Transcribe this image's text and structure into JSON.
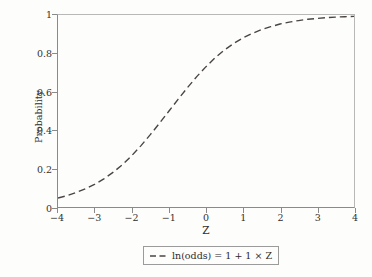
{
  "chart_data": {
    "type": "line",
    "title": "",
    "subtitle": "",
    "xlabel": "Z",
    "ylabel": "Probability",
    "xlim": [
      -4,
      4
    ],
    "ylim": [
      0,
      1
    ],
    "grid": false,
    "legend_position": "bottom-outside",
    "xticks": [
      "-4",
      "-3",
      "-2",
      "-1",
      "0",
      "1",
      "2",
      "3",
      "4"
    ],
    "xtick_values": [
      -4,
      -3,
      -2,
      -1,
      0,
      1,
      2,
      3,
      4
    ],
    "yticks": [
      "0",
      "0.2",
      "0.4",
      "0.6",
      "0.8",
      "1"
    ],
    "ytick_values": [
      0,
      0.2,
      0.4,
      0.6,
      0.8,
      1
    ],
    "series": [
      {
        "name": "ln(odds) = 1 + 1 × Z",
        "style": "dashed",
        "color": "#4a4542",
        "equation": "p = 1 / (1 + exp(-(1 + 1*Z)))",
        "x": [
          -4,
          -3.75,
          -3.5,
          -3.25,
          -3,
          -2.75,
          -2.5,
          -2.25,
          -2,
          -1.75,
          -1.5,
          -1.25,
          -1,
          -0.75,
          -0.5,
          -0.25,
          0,
          0.25,
          0.5,
          0.75,
          1,
          1.25,
          1.5,
          1.75,
          2,
          2.25,
          2.5,
          2.75,
          3,
          3.25,
          3.5,
          3.75,
          4
        ],
        "y": [
          0.047,
          0.059,
          0.076,
          0.096,
          0.119,
          0.148,
          0.182,
          0.222,
          0.269,
          0.321,
          0.378,
          0.438,
          0.5,
          0.562,
          0.622,
          0.679,
          0.731,
          0.778,
          0.818,
          0.852,
          0.881,
          0.904,
          0.924,
          0.939,
          0.953,
          0.963,
          0.971,
          0.978,
          0.982,
          0.986,
          0.989,
          0.991,
          0.993
        ]
      }
    ]
  },
  "legend": {
    "entries": [
      {
        "label": "ln(odds) = 1 + 1 × Z",
        "marker": "dashed-line-swatch"
      }
    ]
  },
  "colors": {
    "background": "#fdfdfc",
    "axis": "#8a8a8a",
    "text": "#33302e",
    "curve": "#4a4542",
    "legend_border": "#9b9b9b"
  }
}
